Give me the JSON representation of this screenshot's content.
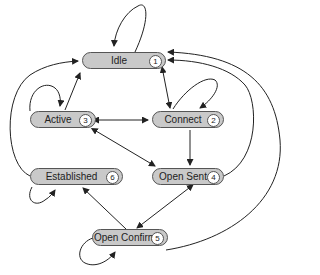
{
  "diagram": {
    "type": "state-machine",
    "node_fill": "#c9c9c9",
    "nodes": [
      {
        "id": "idle",
        "label": "Idle",
        "number": "1"
      },
      {
        "id": "connect",
        "label": "Connect",
        "number": "2"
      },
      {
        "id": "active",
        "label": "Active",
        "number": "3"
      },
      {
        "id": "open_sent",
        "label": "Open Sent",
        "number": "4"
      },
      {
        "id": "open_confirm",
        "label": "Open Confirm",
        "number": "5"
      },
      {
        "id": "established",
        "label": "Established",
        "number": "6"
      }
    ],
    "edges": [
      {
        "from": "idle",
        "to": "idle"
      },
      {
        "from": "idle",
        "to": "connect",
        "bidirectional": true
      },
      {
        "from": "active",
        "to": "idle"
      },
      {
        "from": "active",
        "to": "active"
      },
      {
        "from": "active",
        "to": "connect",
        "bidirectional": true
      },
      {
        "from": "connect",
        "to": "connect"
      },
      {
        "from": "connect",
        "to": "open_sent"
      },
      {
        "from": "active",
        "to": "open_sent",
        "bidirectional": true
      },
      {
        "from": "established",
        "to": "idle"
      },
      {
        "from": "established",
        "to": "established"
      },
      {
        "from": "open_sent",
        "to": "idle"
      },
      {
        "from": "open_sent",
        "to": "open_confirm",
        "bidirectional": true
      },
      {
        "from": "open_confirm",
        "to": "established"
      },
      {
        "from": "open_confirm",
        "to": "open_confirm"
      },
      {
        "from": "open_confirm",
        "to": "idle"
      }
    ]
  }
}
